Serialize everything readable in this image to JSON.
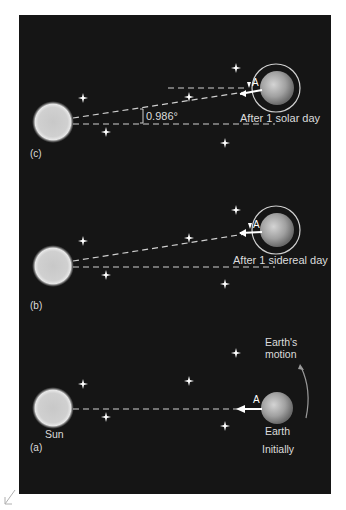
{
  "figure": {
    "panels": [
      {
        "id": "c",
        "label": "(c)",
        "caption": "After 1 solar day",
        "angle_label": "0.986°",
        "point_label": "A"
      },
      {
        "id": "b",
        "label": "(b)",
        "caption": "After 1 sidereal day",
        "point_label": "A"
      },
      {
        "id": "a",
        "label": "(a)",
        "caption": "Initially",
        "sun_label": "Sun",
        "earth_label": "Earth",
        "motion_label_line1": "Earth's",
        "motion_label_line2": "motion",
        "point_label": "A"
      }
    ],
    "colors": {
      "background": "#151515",
      "page": "#ffffff",
      "text": "#dcdcdc",
      "sun": "#d8d8d8",
      "earth": "#9a9a9a",
      "dashed": "#cfcfcf"
    }
  }
}
